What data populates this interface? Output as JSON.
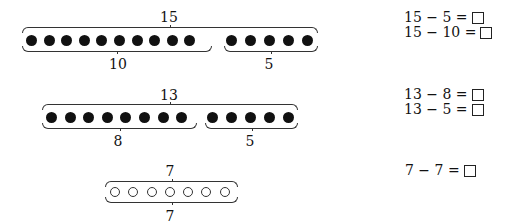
{
  "problems": [
    {
      "total_label": "15",
      "groups": [
        {
          "count": 10,
          "label": "10",
          "fill": "filled"
        },
        {
          "count": 5,
          "label": "5",
          "fill": "filled"
        }
      ],
      "equations": [
        {
          "text": "15 − 5 =",
          "answer": ""
        },
        {
          "text": "15 − 10 =",
          "answer": ""
        }
      ]
    },
    {
      "total_label": "13",
      "groups": [
        {
          "count": 8,
          "label": "8",
          "fill": "filled"
        },
        {
          "count": 5,
          "label": "5",
          "fill": "filled"
        }
      ],
      "equations": [
        {
          "text": "13 − 8 =",
          "answer": ""
        },
        {
          "text": "13 − 5 =",
          "answer": ""
        }
      ]
    },
    {
      "total_label": "7",
      "groups": [
        {
          "count": 7,
          "label": "7",
          "fill": "hollow"
        }
      ],
      "equations": [
        {
          "text": "7 − 7 =",
          "answer": ""
        }
      ]
    }
  ]
}
